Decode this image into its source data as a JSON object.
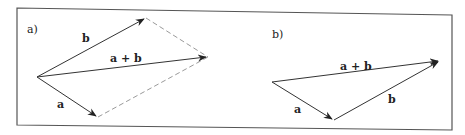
{
  "figure": {
    "panels": [
      {
        "label": "a)",
        "title": "Parallelogram rule",
        "vectors": [
          {
            "name": "b",
            "label": "b",
            "from": [
              37,
              77
            ],
            "to": [
              146,
              18
            ]
          },
          {
            "name": "a+b",
            "label": "a + b",
            "from": [
              37,
              77
            ],
            "to": [
              208,
              57
            ]
          },
          {
            "name": "a",
            "label": "a",
            "from": [
              37,
              77
            ],
            "to": [
              98,
              117
            ]
          }
        ],
        "dashed_edges": [
          {
            "from": [
              146,
              18
            ],
            "to": [
              208,
              57
            ]
          },
          {
            "from": [
              98,
              117
            ],
            "to": [
              208,
              57
            ]
          }
        ]
      },
      {
        "label": "b)",
        "title": "Triangle rule",
        "vectors": [
          {
            "name": "a",
            "label": "a",
            "from": [
              272,
              82
            ],
            "to": [
              334,
              120
            ]
          },
          {
            "name": "b",
            "label": "b",
            "from": [
              334,
              120
            ],
            "to": [
              440,
              61
            ]
          },
          {
            "name": "a+b",
            "label": "a + b",
            "from": [
              272,
              82
            ],
            "to": [
              440,
              61
            ]
          }
        ]
      }
    ],
    "colors": {
      "line": "#333333",
      "dashed": "#9a9a9a",
      "frame": "#555555"
    }
  }
}
